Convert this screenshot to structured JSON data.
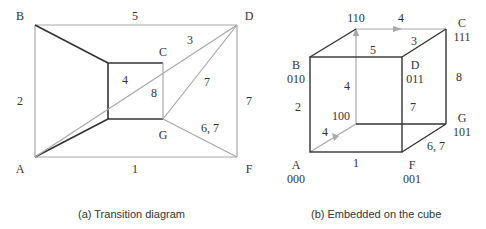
{
  "colors": {
    "dark_edge": "#333333",
    "light_edge": "#a8a8a8",
    "text": "#333333"
  },
  "diagram_a": {
    "caption": "(a) Transition diagram",
    "nodes": {
      "A": "A",
      "B": "B",
      "C": "C",
      "D": "D",
      "F": "F",
      "G": "G"
    },
    "edge_labels": {
      "top": "5",
      "left": "2",
      "bottom": "1",
      "right": "7",
      "diag_CD": "3",
      "diag_GD": "7",
      "diag_GF": "6, 7",
      "diag_AC": "4",
      "inner_CG": "8"
    }
  },
  "diagram_b": {
    "caption": "(b) Embedded on the cube",
    "nodes": {
      "A": {
        "name": "A",
        "code": "000"
      },
      "B": {
        "name": "B",
        "code": "010"
      },
      "C": {
        "name": "C",
        "code": "111"
      },
      "D": {
        "name": "D",
        "code": "011"
      },
      "F": {
        "name": "F",
        "code": "001"
      },
      "G": {
        "name": "G",
        "code": "101"
      },
      "n110": {
        "code": "110"
      },
      "n100": {
        "code": "100"
      }
    },
    "edge_labels": {
      "top_back": "4",
      "top_front": "5",
      "top_right": "3",
      "left_front": "2",
      "back_vertical": "4",
      "bottom_diag": "4",
      "right_front": "7",
      "right_back": "8",
      "bottom_front": "1",
      "bottom_right": "6, 7"
    }
  }
}
